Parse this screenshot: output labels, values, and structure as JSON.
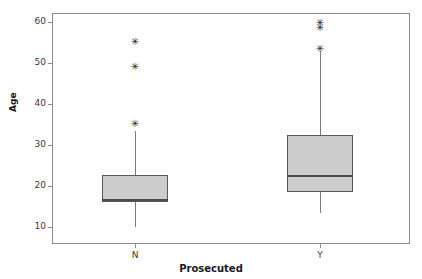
{
  "chart_data": {
    "type": "box",
    "title": "",
    "xlabel": "Prosecuted",
    "ylabel": "Age",
    "categories": [
      "N",
      "Y"
    ],
    "ylim": [
      7,
      63
    ],
    "yticks": [
      10,
      20,
      30,
      40,
      50,
      60
    ],
    "ytick_labels": [
      "10",
      "20",
      "30",
      "40",
      "50",
      "60"
    ],
    "grid": false,
    "legend": null,
    "boxes": [
      {
        "category": "N",
        "whisker_low": 10.0,
        "q1": 16.0,
        "median": 16.5,
        "q3": 22.8,
        "whisker_high": 33.3,
        "outliers": [
          35.0,
          48.8,
          54.8
        ]
      },
      {
        "category": "Y",
        "whisker_low": 13.4,
        "q1": 18.5,
        "median": 22.5,
        "q3": 32.4,
        "whisker_high": 53.0,
        "outliers": [
          53.1,
          58.2,
          59.4
        ]
      }
    ]
  },
  "axes": {
    "y_title": "Age",
    "x_title": "Prosecuted"
  },
  "style": {
    "box_fill": "#cccccc",
    "box_stroke": "#5a5a5a",
    "median_color": "#4a4a4a",
    "whisker_color": "#7a7a7a",
    "frame_color": "#8a8a8a",
    "outlier_glyph": "✳"
  }
}
